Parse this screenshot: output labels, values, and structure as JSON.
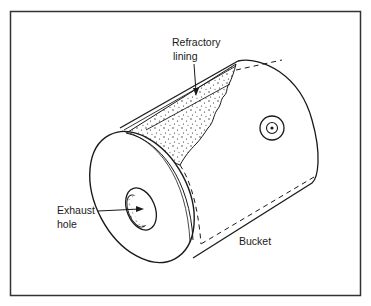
{
  "diagram": {
    "labels": {
      "refractory_line1": "Refractory",
      "refractory_line2": "lining",
      "exhaust_line1": "Exhaust",
      "exhaust_line2": "hole",
      "bucket": "Bucket"
    },
    "colors": {
      "stroke": "#1a1a1a",
      "background": "#ffffff",
      "frame": "#333333"
    }
  }
}
